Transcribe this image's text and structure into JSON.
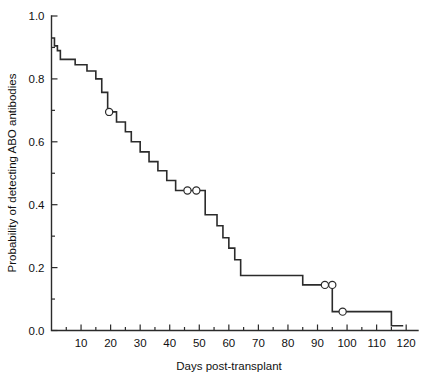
{
  "chart_data": {
    "type": "line",
    "subtype": "kaplan-meier-step-function",
    "title": "",
    "xlabel": "Days post-transplant",
    "ylabel": "Probability of detecting ABO antibodies",
    "xlim": [
      0,
      124
    ],
    "ylim": [
      0.0,
      1.0
    ],
    "grid": false,
    "legend": null,
    "x_ticks": [
      10,
      20,
      30,
      40,
      50,
      60,
      70,
      80,
      90,
      100,
      110,
      120
    ],
    "x_tick_labels": [
      "10",
      "20",
      "30",
      "40",
      "50",
      "60",
      "70",
      "80",
      "90",
      "100",
      "110",
      "120"
    ],
    "x_minor_ticks": [
      5,
      15,
      25,
      35,
      45,
      55,
      65,
      75,
      85,
      95,
      105,
      115
    ],
    "y_ticks": [
      0.0,
      0.2,
      0.4,
      0.6,
      0.8,
      1.0
    ],
    "y_tick_labels": [
      "0.0",
      "0.2",
      "0.4",
      "0.6",
      "0.8",
      "1.0"
    ],
    "y_minor_ticks": [
      0.1,
      0.3,
      0.5,
      0.7,
      0.9
    ],
    "series": [
      {
        "name": "Probability of detecting ABO antibodies",
        "step_points": [
          [
            0,
            0.93
          ],
          [
            1,
            0.93
          ],
          [
            1,
            0.905
          ],
          [
            2,
            0.905
          ],
          [
            2,
            0.89
          ],
          [
            3,
            0.89
          ],
          [
            3,
            0.862
          ],
          [
            8,
            0.862
          ],
          [
            8,
            0.845
          ],
          [
            12,
            0.845
          ],
          [
            12,
            0.825
          ],
          [
            15,
            0.825
          ],
          [
            15,
            0.8
          ],
          [
            17,
            0.8
          ],
          [
            17,
            0.757
          ],
          [
            19,
            0.757
          ],
          [
            19,
            0.695
          ],
          [
            22,
            0.695
          ],
          [
            22,
            0.663
          ],
          [
            25,
            0.663
          ],
          [
            25,
            0.632
          ],
          [
            27,
            0.632
          ],
          [
            27,
            0.6
          ],
          [
            30,
            0.6
          ],
          [
            30,
            0.568
          ],
          [
            33,
            0.568
          ],
          [
            33,
            0.537
          ],
          [
            36,
            0.537
          ],
          [
            36,
            0.508
          ],
          [
            39,
            0.508
          ],
          [
            39,
            0.477
          ],
          [
            42,
            0.477
          ],
          [
            42,
            0.445
          ],
          [
            52,
            0.445
          ],
          [
            52,
            0.368
          ],
          [
            56,
            0.368
          ],
          [
            56,
            0.333
          ],
          [
            58,
            0.333
          ],
          [
            58,
            0.295
          ],
          [
            60,
            0.295
          ],
          [
            60,
            0.262
          ],
          [
            62,
            0.262
          ],
          [
            62,
            0.225
          ],
          [
            64,
            0.225
          ],
          [
            64,
            0.175
          ],
          [
            85,
            0.175
          ],
          [
            85,
            0.145
          ],
          [
            95,
            0.145
          ],
          [
            95,
            0.06
          ],
          [
            115,
            0.06
          ],
          [
            115,
            0.015
          ],
          [
            119,
            0.015
          ]
        ],
        "censored_points": [
          [
            19.5,
            0.695
          ],
          [
            46.0,
            0.445
          ],
          [
            49.0,
            0.445
          ],
          [
            92.5,
            0.145
          ],
          [
            95.0,
            0.145
          ],
          [
            98.5,
            0.06
          ]
        ]
      }
    ],
    "colors": {
      "line": "#2b2b2b",
      "axis": "#2b2b2b",
      "background": "#ffffff",
      "censor_fill": "#ffffff"
    }
  }
}
